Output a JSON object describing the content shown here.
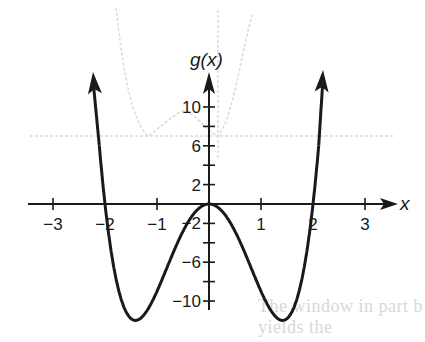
{
  "chart_data": {
    "type": "line",
    "title": "",
    "function_label": "g(x)",
    "xlabel": "x",
    "ylabel": "g(x)",
    "xlim": [
      -3.2,
      3.5
    ],
    "ylim": [
      -12.5,
      14
    ],
    "x_ticks": [
      -3,
      -2,
      -1,
      1,
      2,
      3
    ],
    "x_tick_labels": [
      "−3",
      "−2",
      "−1",
      "1",
      "2",
      "3"
    ],
    "y_ticks": [
      10,
      8,
      6,
      4,
      2,
      -2,
      -4,
      -6,
      -8,
      -10
    ],
    "y_tick_labels": [
      {
        "value": 10,
        "label": "10"
      },
      {
        "value": 6,
        "label": "6"
      },
      {
        "value": 2,
        "label": "2"
      },
      {
        "value": -2,
        "label": "−2"
      },
      {
        "value": -6,
        "label": "−6"
      },
      {
        "value": -10,
        "label": "−10"
      }
    ],
    "grid": false,
    "legend": null,
    "series": [
      {
        "name": "g(x)",
        "formula": "3x^4 - 12x^2",
        "end_behavior": "arrows upward at both ends",
        "zeros": [
          -2,
          0,
          2
        ],
        "local_max": [
          [
            0,
            0
          ]
        ],
        "local_min": [
          [
            -1.41,
            -12
          ],
          [
            1.41,
            -12
          ]
        ],
        "x": [
          -2.15,
          -2.0,
          -1.8,
          -1.6,
          -1.41,
          -1.2,
          -1.0,
          -0.8,
          -0.6,
          -0.4,
          -0.2,
          0,
          0.2,
          0.4,
          0.6,
          0.8,
          1.0,
          1.2,
          1.41,
          1.6,
          1.8,
          2.0,
          2.15
        ],
        "y": [
          9.5,
          0,
          -7.4,
          -11.0,
          -12.0,
          -11.1,
          -9.0,
          -6.45,
          -3.93,
          -1.84,
          -0.48,
          0,
          -0.48,
          -1.84,
          -3.93,
          -6.45,
          -9.0,
          -11.1,
          -12.0,
          -11.0,
          -7.4,
          0,
          9.5
        ]
      }
    ],
    "background_ghost": {
      "description": "faint show-through of another graph and text from reverse side of page",
      "text_fragment": "The window in part b yields the"
    }
  },
  "labels": {
    "y_axis": "g(x)",
    "x_axis": "x"
  },
  "ghost_text": "The window in part b yields the"
}
